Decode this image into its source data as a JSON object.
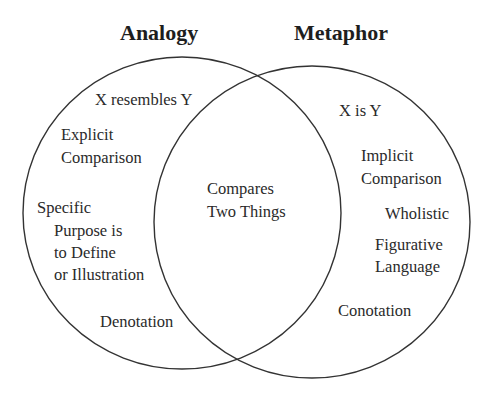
{
  "diagram": {
    "type": "venn",
    "sets": [
      {
        "id": "analogy",
        "title": "Analogy",
        "unique_items": [
          "X resembles Y",
          "Explicit Comparison",
          "Specific",
          "Purpose is to Define or Illustration",
          "Denotation"
        ]
      },
      {
        "id": "metaphor",
        "title": "Metaphor",
        "unique_items": [
          "X is Y",
          "Implicit Comparison",
          "Wholistic",
          "Figurative Language",
          "Conotation"
        ]
      }
    ],
    "intersection": {
      "items": [
        "Compares Two Things"
      ]
    }
  },
  "titles": {
    "analogy": "Analogy",
    "metaphor": "Metaphor"
  },
  "analogy_labels": {
    "resembles": "X resembles Y",
    "explicit_l1": "Explicit",
    "explicit_l2": "Comparison",
    "specific": "Specific",
    "purpose_l1": "Purpose is",
    "purpose_l2": "to Define",
    "purpose_l3": "or Illustration",
    "denotation": "Denotation"
  },
  "overlap_labels": {
    "compares_l1": "Compares",
    "compares_l2": "Two Things"
  },
  "metaphor_labels": {
    "is": "X is Y",
    "implicit_l1": "Implicit",
    "implicit_l2": "Comparison",
    "wholistic": "Wholistic",
    "figurative_l1": "Figurative",
    "figurative_l2": "Language",
    "conotation": "Conotation"
  },
  "colors": {
    "background": "#ffffff",
    "stroke": "#333333",
    "text": "#2a2a2a"
  }
}
